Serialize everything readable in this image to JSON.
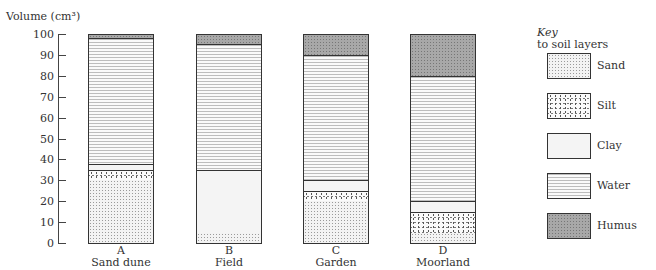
{
  "chart_data": {
    "type": "bar",
    "subtype": "stacked-column",
    "title": "",
    "ylabel": "Volume (cm³)",
    "xlabel": "",
    "ylim": [
      0,
      100
    ],
    "yticks": [
      0,
      10,
      20,
      30,
      40,
      50,
      60,
      70,
      80,
      90,
      100
    ],
    "grid": false,
    "legend_position": "right",
    "legend_title": "Key",
    "legend_subtitle": "to soil layers",
    "categories": [
      "A\nSand dune",
      "B\nField",
      "C\nGarden",
      "D\nMoorland"
    ],
    "category_letters": [
      "A",
      "B",
      "C",
      "D"
    ],
    "category_names": [
      "Sand dune",
      "Field",
      "Garden",
      "Moorland"
    ],
    "series": [
      {
        "name": "Sand",
        "values": [
          30,
          5,
          20,
          5
        ]
      },
      {
        "name": "Silt",
        "values": [
          5,
          0,
          5,
          10
        ]
      },
      {
        "name": "Clay",
        "values": [
          3,
          30,
          5,
          5
        ]
      },
      {
        "name": "Water",
        "values": [
          60,
          60,
          60,
          60
        ]
      },
      {
        "name": "Humus",
        "values": [
          2,
          5,
          10,
          20
        ]
      }
    ]
  },
  "axis": {
    "label": "Volume (cm³)",
    "ticks": [
      "0",
      "10",
      "20",
      "30",
      "40",
      "50",
      "60",
      "70",
      "80",
      "90",
      "100"
    ]
  },
  "bars": [
    {
      "letter": "A",
      "name": "Sand dune",
      "layers": [
        [
          "sand",
          30
        ],
        [
          "silt",
          5
        ],
        [
          "clay",
          3
        ],
        [
          "water",
          60
        ],
        [
          "humus",
          2
        ]
      ]
    },
    {
      "letter": "B",
      "name": "Field",
      "layers": [
        [
          "sand",
          5
        ],
        [
          "silt",
          0
        ],
        [
          "clay",
          30
        ],
        [
          "water",
          60
        ],
        [
          "humus",
          5
        ]
      ]
    },
    {
      "letter": "C",
      "name": "Garden",
      "layers": [
        [
          "sand",
          20
        ],
        [
          "silt",
          5
        ],
        [
          "clay",
          5
        ],
        [
          "water",
          60
        ],
        [
          "humus",
          10
        ]
      ]
    },
    {
      "letter": "D",
      "name": "Moorland",
      "layers": [
        [
          "sand",
          5
        ],
        [
          "silt",
          10
        ],
        [
          "clay",
          5
        ],
        [
          "water",
          60
        ],
        [
          "humus",
          20
        ]
      ]
    }
  ],
  "key": {
    "title": "Key",
    "subtitle": "to soil layers",
    "items": [
      {
        "label": "Sand",
        "pattern": "sand"
      },
      {
        "label": "Silt",
        "pattern": "silt"
      },
      {
        "label": "Clay",
        "pattern": "clay"
      },
      {
        "label": "Water",
        "pattern": "water"
      },
      {
        "label": "Humus",
        "pattern": "humus"
      }
    ]
  }
}
